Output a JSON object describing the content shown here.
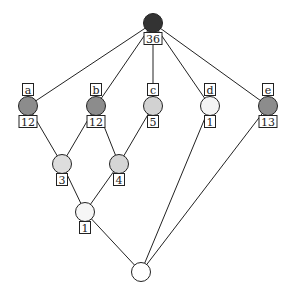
{
  "diagram": {
    "type": "lattice",
    "nodes": [
      {
        "id": "top",
        "x": 153,
        "y": 23,
        "fill": "#333333",
        "top_label": null,
        "bottom_label": "36"
      },
      {
        "id": "a",
        "x": 28,
        "y": 106,
        "fill": "#8c8c8c",
        "top_label": "a",
        "bottom_label": "12"
      },
      {
        "id": "b",
        "x": 96,
        "y": 106,
        "fill": "#8c8c8c",
        "top_label": "b",
        "bottom_label": "12"
      },
      {
        "id": "c",
        "x": 153,
        "y": 106,
        "fill": "#d2d2d2",
        "top_label": "c",
        "bottom_label": "5"
      },
      {
        "id": "d",
        "x": 210,
        "y": 106,
        "fill": "#f4f4f4",
        "top_label": "d",
        "bottom_label": "1"
      },
      {
        "id": "e",
        "x": 268,
        "y": 106,
        "fill": "#8c8c8c",
        "top_label": "e",
        "bottom_label": "13"
      },
      {
        "id": "n3",
        "x": 62,
        "y": 164,
        "fill": "#dddddd",
        "top_label": null,
        "bottom_label": "3"
      },
      {
        "id": "n4",
        "x": 119,
        "y": 164,
        "fill": "#d5d5d5",
        "top_label": null,
        "bottom_label": "4"
      },
      {
        "id": "n1",
        "x": 85,
        "y": 212,
        "fill": "#f6f6f6",
        "top_label": null,
        "bottom_label": "1"
      },
      {
        "id": "bottom",
        "x": 141,
        "y": 272,
        "fill": "#ffffff",
        "top_label": null,
        "bottom_label": null
      }
    ],
    "edges": [
      [
        "top",
        "a"
      ],
      [
        "top",
        "b"
      ],
      [
        "top",
        "c"
      ],
      [
        "top",
        "d"
      ],
      [
        "top",
        "e"
      ],
      [
        "a",
        "n3"
      ],
      [
        "b",
        "n3"
      ],
      [
        "b",
        "n4"
      ],
      [
        "c",
        "n4"
      ],
      [
        "n3",
        "n1"
      ],
      [
        "n4",
        "n1"
      ],
      [
        "n1",
        "bottom"
      ],
      [
        "d",
        "bottom"
      ],
      [
        "e",
        "bottom"
      ]
    ]
  }
}
